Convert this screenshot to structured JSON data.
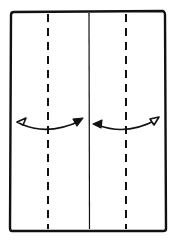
{
  "diagram": {
    "type": "origami-fold-instruction",
    "paper": {
      "shape": "rectangle",
      "orientation": "portrait",
      "x": 10,
      "y": 12,
      "width": 155,
      "height": 219
    },
    "lines": [
      {
        "kind": "valley-fold",
        "style": "dashed",
        "x": 48
      },
      {
        "kind": "crease",
        "style": "solid",
        "x": 89
      },
      {
        "kind": "valley-fold",
        "style": "dashed",
        "x": 126
      }
    ],
    "arrows": [
      {
        "kind": "fold-and-unfold",
        "from_x": 17,
        "to_x": 82,
        "y": 122,
        "direction": "two-way"
      },
      {
        "kind": "fold-and-unfold",
        "from_x": 94,
        "to_x": 158,
        "y": 122,
        "direction": "two-way"
      }
    ],
    "colors": {
      "ink": "#111111",
      "paper": "#ffffff"
    }
  }
}
